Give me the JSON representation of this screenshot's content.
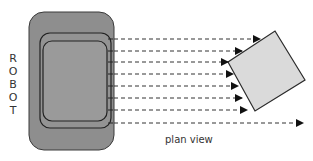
{
  "diagram": {
    "side_label": "ROBOT",
    "side_label_letters": [
      "R",
      "O",
      "B",
      "O",
      "T"
    ],
    "caption": "plan view",
    "colors": {
      "robot_body": "#8e8e8e",
      "robot_outline": "#2e2e2e",
      "inner_panel": "#9a9a9a",
      "obstacle_fill": "#dadada",
      "obstacle_outline": "#2a2a2a",
      "ray": "#333333",
      "text": "#333333"
    },
    "sensor_rays": [
      {
        "index": 1,
        "y": 39,
        "end_x": 260,
        "hits_obstacle": true
      },
      {
        "index": 2,
        "y": 51,
        "end_x": 242,
        "hits_obstacle": true
      },
      {
        "index": 3,
        "y": 62,
        "end_x": 228,
        "hits_obstacle": true
      },
      {
        "index": 4,
        "y": 74,
        "end_x": 233,
        "hits_obstacle": true
      },
      {
        "index": 5,
        "y": 86,
        "end_x": 238,
        "hits_obstacle": true
      },
      {
        "index": 6,
        "y": 98,
        "end_x": 242,
        "hits_obstacle": true
      },
      {
        "index": 7,
        "y": 110,
        "end_x": 247,
        "hits_obstacle": true
      },
      {
        "index": 8,
        "y": 123,
        "end_x": 303,
        "hits_obstacle": false
      }
    ]
  }
}
